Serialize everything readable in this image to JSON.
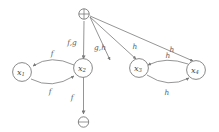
{
  "diagram": {
    "background_color": "#ffffff",
    "stroke_color": "#7a7a7a",
    "text_color": "#5a5a5a",
    "nodes": [
      {
        "id": "source",
        "label": "⊕",
        "kind": "source-terminal",
        "cx": 84,
        "cy": 14
      },
      {
        "id": "x1",
        "label": "x",
        "sub": "1",
        "kind": "state",
        "cx": 22,
        "cy": 72
      },
      {
        "id": "x2",
        "label": "x",
        "sub": "2",
        "kind": "state",
        "cx": 83,
        "cy": 68
      },
      {
        "id": "x3",
        "label": "x",
        "sub": "3",
        "kind": "state",
        "cx": 139,
        "cy": 68
      },
      {
        "id": "x4",
        "label": "x",
        "sub": "4",
        "kind": "state",
        "cx": 196,
        "cy": 70
      },
      {
        "id": "sink",
        "label": "⊖",
        "kind": "sink-terminal",
        "cx": 83,
        "cy": 122
      }
    ],
    "edges": [
      {
        "id": "source-to-x2",
        "from": "source",
        "to": "x2",
        "label": "f,g",
        "label_x": 72,
        "label_y": 43
      },
      {
        "id": "source-to-x2-diag",
        "from": "source",
        "to": "x2",
        "label": "g,h",
        "label_x": 100,
        "label_y": 48
      },
      {
        "id": "source-to-x3",
        "from": "source",
        "to": "x3",
        "label": "h",
        "label_x": 135,
        "label_y": 47
      },
      {
        "id": "source-to-x4",
        "from": "source",
        "to": "x4",
        "label": "h",
        "label_x": 172,
        "label_y": 50
      },
      {
        "id": "x2-to-x1",
        "from": "x2",
        "to": "x1",
        "label": "f",
        "label_x": 52,
        "label_y": 54
      },
      {
        "id": "x1-to-x2",
        "from": "x1",
        "to": "x2",
        "label": "f",
        "label_x": 50,
        "label_y": 92
      },
      {
        "id": "x4-to-x3",
        "from": "x4",
        "to": "x3",
        "label": "h",
        "label_x": 168,
        "label_y": 56
      },
      {
        "id": "x3-to-x4",
        "from": "x3",
        "to": "x4",
        "label": "h",
        "label_x": 167,
        "label_y": 93
      },
      {
        "id": "x2-to-sink",
        "from": "x2",
        "to": "sink",
        "label": "f",
        "label_x": 72,
        "label_y": 98
      }
    ]
  }
}
